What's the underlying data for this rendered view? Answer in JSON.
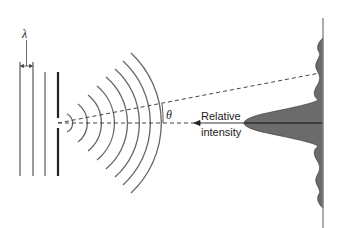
{
  "diagram": {
    "labels": {
      "wavelength": "λ",
      "angle": "θ",
      "intensity_line1": "Relative",
      "intensity_line2": "intensity"
    },
    "elements": {
      "incident_wavefronts": 3,
      "barrier_with_slit": true,
      "diffracted_wavefronts": 8,
      "screen": true,
      "intensity_pattern": "central maximum with decreasing side lobes"
    },
    "colors": {
      "line": "#555555",
      "barrier": "#222222",
      "intensity_fill": "#6b6b6b",
      "background": "#ffffff"
    }
  }
}
